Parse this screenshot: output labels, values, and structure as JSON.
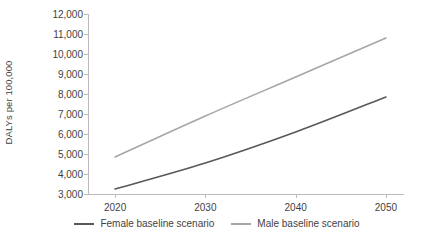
{
  "chart_data": {
    "type": "line",
    "title": "",
    "xlabel": "",
    "ylabel": "DALYs per 100,000",
    "x": [
      2020,
      2030,
      2040,
      2050
    ],
    "xtick_labels": [
      "2020",
      "2030",
      "2040",
      "2050"
    ],
    "ytick_labels": [
      "12,000",
      "11,000",
      "10,000",
      "9,000",
      "8,000",
      "7,000",
      "6,000",
      "5,000",
      "4,000",
      "3,000"
    ],
    "yticks": [
      12000,
      11000,
      10000,
      9000,
      8000,
      7000,
      6000,
      5000,
      4000,
      3000
    ],
    "ylim": [
      3000,
      12000
    ],
    "xlim": [
      2017,
      2052
    ],
    "grid": false,
    "legend_position": "bottom",
    "series": [
      {
        "name": "Female baseline scenario",
        "color": "#585858",
        "values": [
          3250,
          4550,
          6100,
          7850
        ]
      },
      {
        "name": "Male baseline scenario",
        "color": "#a6a6a6",
        "values": [
          4850,
          6900,
          8850,
          10800
        ]
      }
    ]
  },
  "legend": {
    "items": [
      {
        "label": "Female baseline scenario",
        "color": "#585858"
      },
      {
        "label": "Male baseline scenario",
        "color": "#a6a6a6"
      }
    ]
  },
  "axis": {
    "y_title": "DALYs per 100,000"
  }
}
